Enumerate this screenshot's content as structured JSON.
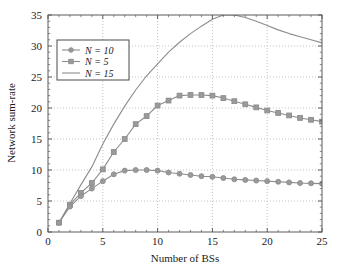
{
  "chart_data": {
    "type": "line",
    "title": "",
    "xlabel": "Number of BSs",
    "ylabel": "Network sum-rate",
    "xlim": [
      0,
      25
    ],
    "ylim": [
      0,
      35
    ],
    "xticks": [
      0,
      5,
      10,
      15,
      20,
      25
    ],
    "yticks": [
      0,
      5,
      10,
      15,
      20,
      25,
      30,
      35
    ],
    "xtick_labels": [
      "0",
      "5",
      "10",
      "15",
      "20",
      "25"
    ],
    "ytick_labels": [
      "0",
      "5",
      "10",
      "15",
      "20",
      "25",
      "30",
      "35"
    ],
    "grid": true,
    "legend_position": "upper left",
    "x": [
      1,
      2,
      3,
      4,
      5,
      6,
      7,
      8,
      9,
      10,
      11,
      12,
      13,
      14,
      15,
      16,
      17,
      18,
      19,
      20,
      21,
      22,
      23,
      24,
      25
    ],
    "series": [
      {
        "name": "N = 10",
        "label": "N = 10",
        "marker": "circle",
        "color": "#8c8c8c",
        "values": [
          1.5,
          4.1,
          5.8,
          7.0,
          8.2,
          9.3,
          9.9,
          10.0,
          10.0,
          9.9,
          9.6,
          9.4,
          9.2,
          9.0,
          8.9,
          8.7,
          8.5,
          8.4,
          8.3,
          8.2,
          8.1,
          8.0,
          7.9,
          7.85,
          7.8
        ]
      },
      {
        "name": "N = 5",
        "label": "N = 5",
        "marker": "square",
        "color": "#8c8c8c",
        "values": [
          1.5,
          4.4,
          6.3,
          7.9,
          10.1,
          12.9,
          15.0,
          17.4,
          18.7,
          20.4,
          21.2,
          22.0,
          22.1,
          22.1,
          22.0,
          21.6,
          21.1,
          20.6,
          20.1,
          19.6,
          19.2,
          18.8,
          18.4,
          18.1,
          17.8
        ]
      },
      {
        "name": "N = 15",
        "label": "N = 15",
        "marker": "none",
        "color": "#8c8c8c",
        "values": [
          1.5,
          4.6,
          7.6,
          10.5,
          14.2,
          17.4,
          20.3,
          22.9,
          25.2,
          27.1,
          29.0,
          30.6,
          32.0,
          33.2,
          34.3,
          35.0,
          35.0,
          34.6,
          34.0,
          33.3,
          32.6,
          32.0,
          31.5,
          31.0,
          30.5
        ]
      }
    ]
  }
}
